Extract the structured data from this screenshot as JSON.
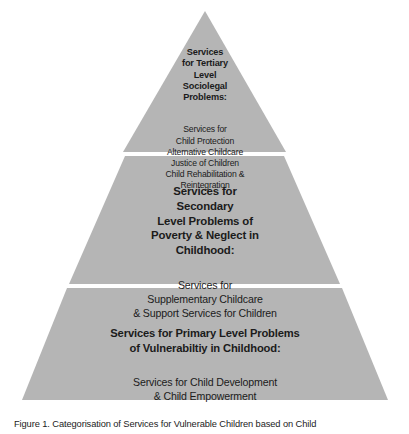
{
  "figure": {
    "name": "services-pyramid",
    "fill_color": "#b5b5b5",
    "divider_color": "#ffffff",
    "text_color": "#1b1b1b",
    "background_color": "#ffffff"
  },
  "tiers": {
    "tertiary": {
      "heading": "Services\nfor Tertiary\nLevel\nSociolegal\nProblems:",
      "body": "Services for\nChild Protection\nAlternative Childcare\nJustice of Children\nChild Rehabilitation &\nReintegration"
    },
    "secondary": {
      "heading": "Services for\nSecondary\nLevel Problems of\nPoverty & Neglect in\nChildhood:",
      "body": "Services for\nSupplementary Childcare\n& Support Services for Children"
    },
    "primary": {
      "heading": "Services for Primary Level Problems\nof Vulnerabiltiy in Childhood:",
      "body": "Services for Child Development\n&  Child Empowerment"
    }
  },
  "caption": {
    "text": "Figure 1. Categorisation of Services for Vulnerable Children based on Child"
  }
}
